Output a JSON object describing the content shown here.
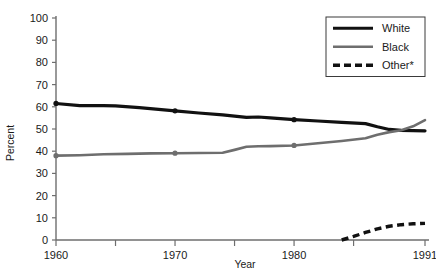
{
  "chart_data": {
    "type": "line",
    "title": "",
    "xlabel": "Year",
    "ylabel": "Percent",
    "xlim": [
      1960,
      1991
    ],
    "ylim": [
      0,
      100
    ],
    "grid": false,
    "legend_position": "top-right",
    "y_ticks": [
      0,
      10,
      20,
      30,
      40,
      50,
      60,
      70,
      80,
      90,
      100
    ],
    "y_tick_labels": [
      "0",
      "10",
      "20",
      "30",
      "40",
      "50",
      "60",
      "70",
      "80",
      "90",
      "100"
    ],
    "x_ticks": [
      1960,
      1965,
      1970,
      1975,
      1980,
      1985,
      1991
    ],
    "x_tick_labels": [
      "1960",
      "",
      "1970",
      "",
      "1980",
      "",
      "1991"
    ],
    "x_labeled_ticks": [
      {
        "year": 1960,
        "label": "1960"
      },
      {
        "year": 1970,
        "label": "1970"
      },
      {
        "year": 1980,
        "label": "1980"
      },
      {
        "year": 1991,
        "label": "1991"
      }
    ],
    "series": [
      {
        "name": "White",
        "color": "#111111",
        "style": "solid",
        "width": 3.2,
        "markers_at": [
          1960,
          1970,
          1980
        ],
        "x": [
          1960,
          1962,
          1964,
          1965,
          1967,
          1970,
          1972,
          1974,
          1976,
          1977,
          1978,
          1980,
          1982,
          1984,
          1986,
          1987,
          1988,
          1989,
          1990,
          1991
        ],
        "values": [
          61.5,
          60.5,
          60.5,
          60.4,
          59.6,
          58.2,
          57.2,
          56.4,
          55.2,
          55.4,
          55.0,
          54.2,
          53.6,
          53.0,
          52.4,
          51.0,
          49.8,
          49.4,
          49.3,
          49.2
        ]
      },
      {
        "name": "Black",
        "color": "#6e6e6e",
        "style": "solid",
        "width": 2.6,
        "markers_at": [
          1960,
          1970,
          1980
        ],
        "x": [
          1960,
          1962,
          1964,
          1966,
          1968,
          1970,
          1972,
          1974,
          1975,
          1976,
          1977,
          1978,
          1980,
          1982,
          1984,
          1986,
          1987,
          1988,
          1989,
          1990,
          1991
        ],
        "values": [
          38.0,
          38.2,
          38.6,
          38.8,
          39.0,
          39.1,
          39.2,
          39.3,
          40.6,
          42.0,
          42.2,
          42.3,
          42.6,
          43.6,
          44.6,
          45.8,
          47.4,
          48.6,
          49.4,
          51.2,
          54.0
        ]
      },
      {
        "name": "Other*",
        "color": "#111111",
        "style": "dashed",
        "width": 3.4,
        "markers_at": [],
        "x": [
          1984,
          1985,
          1986,
          1987,
          1988,
          1989,
          1990,
          1991
        ],
        "values": [
          0.0,
          1.6,
          3.4,
          5.0,
          6.2,
          6.9,
          7.3,
          7.5
        ]
      }
    ],
    "legend_entries": [
      {
        "label": "White",
        "color": "#111111",
        "style": "solid"
      },
      {
        "label": "Black",
        "color": "#6e6e6e",
        "style": "solid"
      },
      {
        "label": "Other*",
        "color": "#111111",
        "style": "dashed"
      }
    ]
  },
  "axis": {
    "color": "#6e6e6e"
  }
}
